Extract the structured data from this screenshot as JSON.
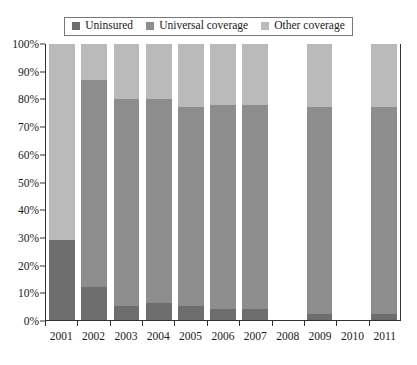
{
  "chart_data": {
    "type": "bar",
    "subtype": "stacked-percentage",
    "title": "",
    "xlabel": "",
    "ylabel": "",
    "ylim": [
      0,
      100
    ],
    "ytick_labels": [
      "0%",
      "10%",
      "20%",
      "30%",
      "40%",
      "50%",
      "60%",
      "70%",
      "80%",
      "90%",
      "100%"
    ],
    "ytick_values": [
      0,
      10,
      20,
      30,
      40,
      50,
      60,
      70,
      80,
      90,
      100
    ],
    "grid": false,
    "legend_position": "top-center",
    "categories": [
      "2001",
      "2002",
      "2003",
      "2004",
      "2005",
      "2006",
      "2007",
      "2008",
      "2009",
      "2010",
      "2011"
    ],
    "series": [
      {
        "name": "Uninsured",
        "color": "#6e6e6e",
        "values": [
          29,
          12,
          5,
          6,
          5,
          4,
          4,
          null,
          2,
          null,
          2
        ]
      },
      {
        "name": "Universal coverage",
        "color": "#8d8d8d",
        "values": [
          0,
          75,
          75,
          74,
          72,
          74,
          74,
          null,
          75,
          null,
          75
        ]
      },
      {
        "name": "Other coverage",
        "color": "#bababa",
        "values": [
          71,
          13,
          20,
          20,
          23,
          22,
          22,
          null,
          23,
          null,
          23
        ]
      }
    ],
    "empty_categories": [
      "2008",
      "2010"
    ]
  },
  "legend": {
    "items": [
      {
        "label": "Uninsured",
        "color": "#6e6e6e"
      },
      {
        "label": "Universal coverage",
        "color": "#8d8d8d"
      },
      {
        "label": "Other coverage",
        "color": "#bababa"
      }
    ]
  }
}
